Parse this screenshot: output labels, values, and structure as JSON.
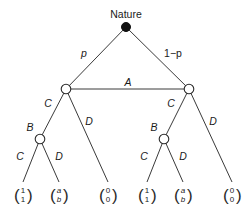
{
  "diagram": {
    "type": "extensive-form game tree",
    "root": {
      "label": "Nature"
    },
    "chance_branches": {
      "left": "p",
      "right": "1−p"
    },
    "information_set_label": "A",
    "player_B_label": "B",
    "actions": {
      "cooperate": "C",
      "defect": "D"
    },
    "left_subtree": {
      "A_actions": {
        "left": "C",
        "right": "D"
      },
      "B_actions": {
        "left": "C",
        "right": "D"
      },
      "payoffs": [
        {
          "top": "1",
          "bottom": "1",
          "italic": false
        },
        {
          "top": "a",
          "bottom": "b",
          "italic": true
        },
        {
          "top": "0",
          "bottom": "0",
          "italic": false
        }
      ]
    },
    "right_subtree": {
      "A_actions": {
        "left": "C",
        "right": "D"
      },
      "B_actions": {
        "left": "C",
        "right": "D"
      },
      "payoffs": [
        {
          "top": "1",
          "bottom": "1",
          "italic": false
        },
        {
          "top": "a",
          "bottom": "b",
          "italic": true
        },
        {
          "top": "0",
          "bottom": "0",
          "italic": false
        }
      ]
    }
  }
}
